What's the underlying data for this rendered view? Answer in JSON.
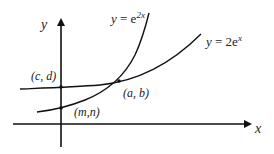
{
  "diagram": {
    "axes": {
      "x_label": "x",
      "y_label": "y"
    },
    "curves": [
      {
        "name": "exp-2x",
        "label_prefix": "y = e",
        "label_exp": "2x"
      },
      {
        "name": "two-exp-x",
        "label_prefix": "y = 2e",
        "label_exp": "x"
      }
    ],
    "points": {
      "c_d": "(c, d)",
      "a_b": "(a, b)",
      "m_n": "(m,n)"
    }
  }
}
